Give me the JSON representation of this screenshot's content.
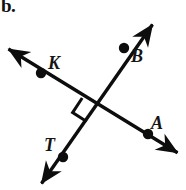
{
  "figure": {
    "part_label": "b.",
    "background_color": "#ffffff",
    "stroke_color": "#0d0d0d",
    "width": 186,
    "height": 190,
    "intersection": {
      "x": 96,
      "y": 107,
      "angle_marker": "right-angle-square"
    },
    "lines": [
      {
        "name": "line-KA",
        "start_arrow": {
          "x": 5,
          "y": 47
        },
        "end_arrow": {
          "x": 181,
          "y": 155
        },
        "points": [
          "K",
          "A"
        ]
      },
      {
        "name": "line-TB",
        "start_arrow": {
          "x": 39,
          "y": 187
        },
        "end_arrow": {
          "x": 155,
          "y": 20
        },
        "points": [
          "T",
          "B"
        ]
      }
    ],
    "points": [
      {
        "label": "K",
        "x": 41,
        "y": 73,
        "on_line": "line-KA"
      },
      {
        "label": "A",
        "x": 148,
        "y": 134,
        "on_line": "line-KA"
      },
      {
        "label": "B",
        "x": 124,
        "y": 48,
        "on_line": "line-TB"
      },
      {
        "label": "T",
        "x": 63,
        "y": 157,
        "on_line": "line-TB"
      }
    ]
  }
}
